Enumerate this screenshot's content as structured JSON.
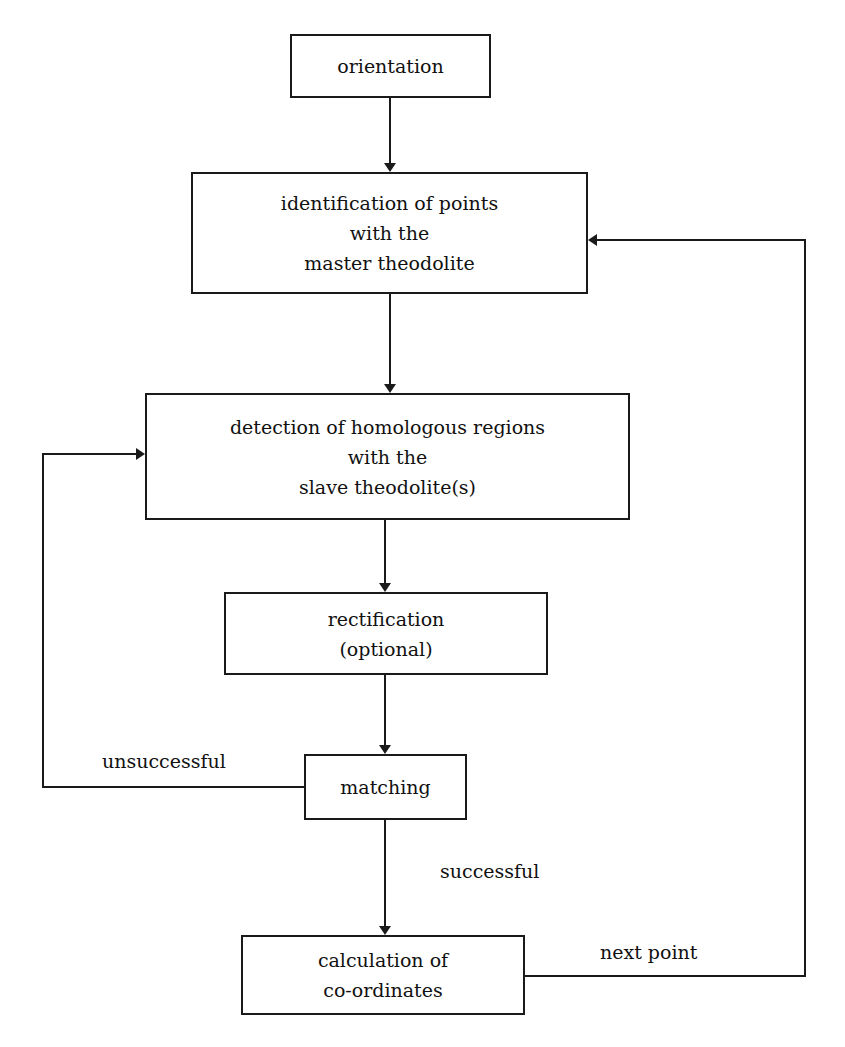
{
  "diagram": {
    "type": "flowchart",
    "colors": {
      "line": "#1a1a1a",
      "background": "#ffffff",
      "text": "#111111"
    },
    "nodes": [
      {
        "id": "orientation",
        "lines": [
          "orientation"
        ]
      },
      {
        "id": "identification",
        "lines": [
          "identification of points",
          "with the",
          "master theodolite"
        ]
      },
      {
        "id": "detection",
        "lines": [
          "detection of homologous regions",
          "with the",
          "slave theodolite(s)"
        ]
      },
      {
        "id": "rectification",
        "lines": [
          "rectification",
          "(optional)"
        ]
      },
      {
        "id": "matching",
        "lines": [
          "matching"
        ]
      },
      {
        "id": "calculation",
        "lines": [
          "calculation of",
          "co-ordinates"
        ]
      }
    ],
    "edge_labels": {
      "unsuccessful": "unsuccessful",
      "successful": "successful",
      "next_point": "next point"
    },
    "edges": [
      {
        "from": "orientation",
        "to": "identification",
        "label": ""
      },
      {
        "from": "identification",
        "to": "detection",
        "label": ""
      },
      {
        "from": "detection",
        "to": "rectification",
        "label": ""
      },
      {
        "from": "rectification",
        "to": "matching",
        "label": ""
      },
      {
        "from": "matching",
        "to": "detection",
        "label": "unsuccessful"
      },
      {
        "from": "matching",
        "to": "calculation",
        "label": "successful"
      },
      {
        "from": "calculation",
        "to": "identification",
        "label": "next point"
      }
    ]
  }
}
